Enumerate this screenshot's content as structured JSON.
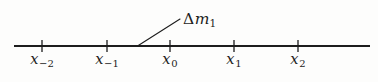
{
  "figure": {
    "background_color": "#fdfdfc",
    "ink_color": "#1d1d1d"
  },
  "axis": {
    "name": "number-line",
    "x_start": 14,
    "x_end": 370,
    "y": 46,
    "stroke_width": 2.2,
    "color": "#1d1d1d"
  },
  "ticks": [
    {
      "id": "tick-xm2",
      "x": 42,
      "label_base": "x",
      "label_sub": "−2",
      "label_text": "x₋₂"
    },
    {
      "id": "tick-xm1",
      "x": 107,
      "label_base": "x",
      "label_sub": "−1",
      "label_text": "x₋₁"
    },
    {
      "id": "tick-x0",
      "x": 170,
      "label_base": "x",
      "label_sub": "0",
      "label_text": "x₀"
    },
    {
      "id": "tick-x1",
      "x": 234,
      "label_base": "x",
      "label_sub": "1",
      "label_text": "x₁"
    },
    {
      "id": "tick-x2",
      "x": 298,
      "label_base": "x",
      "label_sub": "2",
      "label_text": "x₂"
    }
  ],
  "tick_geometry": {
    "half_height": 6,
    "stroke_width": 1.3,
    "label_y": 52
  },
  "annotation": {
    "name": "delta-m1-callout",
    "delta_symbol": "Δ",
    "variable": "m",
    "subscript": "1",
    "full_text": "Δm₁",
    "label_x": 183,
    "label_y": 12,
    "leader_line": {
      "x1": 137.5,
      "y1": 46,
      "x2": 180,
      "y2": 19,
      "stroke_width": 1.1
    }
  },
  "chart_data": {
    "type": "line",
    "xlabel": "",
    "ylabel": "",
    "categories": [
      "x₋₂",
      "x₋₁",
      "x₀",
      "x₁",
      "x₂"
    ],
    "values": [
      -2,
      -1,
      0,
      1,
      2
    ],
    "tick_pixel_x": [
      42,
      107,
      170,
      234,
      298
    ],
    "annotations": [
      "Δm₁"
    ],
    "grid": false,
    "legend": "none"
  }
}
